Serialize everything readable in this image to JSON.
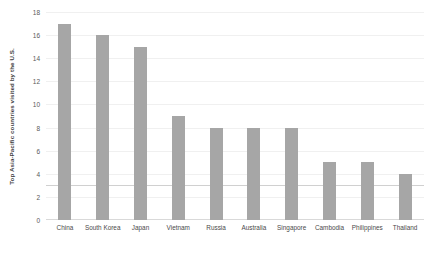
{
  "chart_data": {
    "type": "bar",
    "title": "",
    "xlabel": "",
    "ylabel": "Top Asia-Pacific countries visited by the U.S.",
    "categories": [
      "China",
      "South Korea",
      "Japan",
      "Vietnam",
      "Russia",
      "Australia",
      "Singapore",
      "Cambodia",
      "Philippines",
      "Thailand"
    ],
    "values": [
      17,
      16,
      15,
      9,
      8,
      8,
      8,
      5,
      5,
      4
    ],
    "ylim": [
      0,
      18
    ],
    "ytick_step": 2,
    "ytick_labels": [
      "18",
      "16",
      "14",
      "12",
      "10",
      "8",
      "6",
      "4",
      "2",
      "0"
    ],
    "grid": true,
    "legend": "none",
    "bar_color": "#a6a6a6",
    "background_color": "#ffffff",
    "gridline_color": "#f0f0f0",
    "marker_line_value": 3
  }
}
